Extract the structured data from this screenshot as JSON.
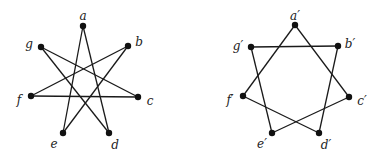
{
  "graphs": [
    {
      "name": "G",
      "vertices": [
        {
          "id": "a",
          "label": "a"
        },
        {
          "id": "b",
          "label": "b"
        },
        {
          "id": "c",
          "label": "c"
        },
        {
          "id": "d",
          "label": "d"
        },
        {
          "id": "e",
          "label": "e"
        },
        {
          "id": "f",
          "label": "f"
        },
        {
          "id": "g",
          "label": "g"
        }
      ],
      "edges": [
        [
          "a",
          "e"
        ],
        [
          "a",
          "d"
        ],
        [
          "g",
          "c"
        ],
        [
          "g",
          "d"
        ],
        [
          "b",
          "f"
        ],
        [
          "b",
          "e"
        ],
        [
          "f",
          "c"
        ]
      ]
    },
    {
      "name": "G'",
      "vertices": [
        {
          "id": "a'",
          "label": "a′"
        },
        {
          "id": "b'",
          "label": "b′"
        },
        {
          "id": "c'",
          "label": "c′"
        },
        {
          "id": "d'",
          "label": "d′"
        },
        {
          "id": "e'",
          "label": "e′"
        },
        {
          "id": "f'",
          "label": "f′"
        },
        {
          "id": "g'",
          "label": "g′"
        }
      ],
      "edges": [
        [
          "a'",
          "f'"
        ],
        [
          "a'",
          "c'"
        ],
        [
          "g'",
          "b'"
        ],
        [
          "g'",
          "e'"
        ],
        [
          "b'",
          "d'"
        ],
        [
          "f'",
          "d'"
        ],
        [
          "e'",
          "c'"
        ]
      ]
    }
  ]
}
